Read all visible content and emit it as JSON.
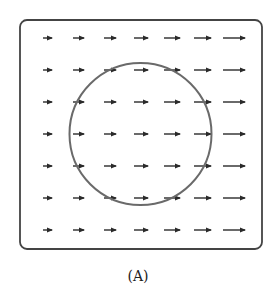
{
  "figure": {
    "caption": "(A)",
    "frame": {
      "x": 20,
      "y": 20,
      "width": 242,
      "height": 229,
      "radius": 7,
      "stroke": "#444444",
      "stroke_width": 1.8
    },
    "circle": {
      "cx": 140.5,
      "cy": 134,
      "r": 71,
      "stroke": "#6a6a6a",
      "stroke_width": 2
    },
    "arrow_color": "#2a2a2a",
    "arrow_grid": {
      "rows_y": [
        38,
        70,
        102,
        134,
        166,
        198,
        230
      ],
      "columns": [
        {
          "x_start": 43,
          "x_end": 52
        },
        {
          "x_start": 73,
          "x_end": 84
        },
        {
          "x_start": 104,
          "x_end": 116
        },
        {
          "x_start": 134,
          "x_end": 148
        },
        {
          "x_start": 164,
          "x_end": 180
        },
        {
          "x_start": 194,
          "x_end": 211
        },
        {
          "x_start": 223,
          "x_end": 245
        }
      ],
      "direction": "right"
    }
  }
}
